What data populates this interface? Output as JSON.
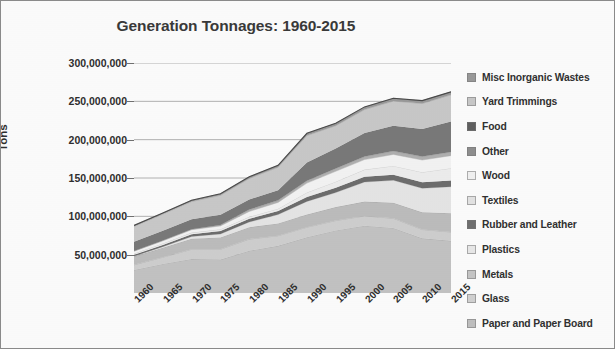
{
  "chart_data": {
    "type": "area",
    "title": "Generation Tonnages: 1960-2015",
    "xlabel": "",
    "ylabel": "Tons",
    "stacked": true,
    "grid": true,
    "legend_position": "right",
    "ylim": [
      0,
      300000000
    ],
    "ytick_labels": [
      "300,000,000",
      "250,000,000",
      "200,000,000",
      "150,000,000",
      "100,000,000",
      "50,000,000"
    ],
    "ytick_values": [
      300000000,
      250000000,
      200000000,
      150000000,
      100000000,
      50000000
    ],
    "categories": [
      "1960",
      "1965",
      "1970",
      "1975",
      "1980",
      "1985",
      "1990",
      "1995",
      "2000",
      "2005",
      "2010",
      "2015"
    ],
    "x": [
      1960,
      1965,
      1970,
      1975,
      1980,
      1985,
      1990,
      1995,
      2000,
      2005,
      2010,
      2015
    ],
    "series": [
      {
        "name": "Paper and Paper Board",
        "color": "#c3c3c3",
        "values": [
          29990000,
          37970000,
          44310000,
          43560000,
          55160000,
          61500000,
          72730000,
          81670000,
          87740000,
          84840000,
          71310000,
          68050000
        ]
      },
      {
        "name": "Glass",
        "color": "#cfcfcf",
        "values": [
          6720000,
          8740000,
          12740000,
          13470000,
          15130000,
          13180000,
          13100000,
          12830000,
          12770000,
          12540000,
          11530000,
          11470000
        ]
      },
      {
        "name": "Metals",
        "color": "#bdbdbd",
        "values": [
          10820000,
          12360000,
          13830000,
          15510000,
          15510000,
          16100000,
          16550000,
          17600000,
          18730000,
          20270000,
          22410000,
          24650000
        ]
      },
      {
        "name": "Plastics",
        "color": "#e6e6e6",
        "values": [
          390000,
          1410000,
          2900000,
          4450000,
          6830000,
          11560000,
          17130000,
          18900000,
          25550000,
          29380000,
          31400000,
          34500000
        ]
      },
      {
        "name": "Rubber and Leather",
        "color": "#6e6e6e",
        "values": [
          1840000,
          2240000,
          2970000,
          4000000,
          4200000,
          4700000,
          5790000,
          6400000,
          6710000,
          7290000,
          7790000,
          8170000
        ]
      },
      {
        "name": "Textiles",
        "color": "#eeeeee",
        "values": [
          1760000,
          1960000,
          2040000,
          2230000,
          2530000,
          2930000,
          5810000,
          7810000,
          9480000,
          11470000,
          13120000,
          16030000
        ]
      },
      {
        "name": "Wood",
        "color": "#f4f4f4",
        "values": [
          3030000,
          3320000,
          3720000,
          4280000,
          7010000,
          8180000,
          12210000,
          13500000,
          13040000,
          14980000,
          15880000,
          16300000
        ]
      },
      {
        "name": "Other",
        "color": "#b0b0b0",
        "values": [
          70000,
          510000,
          770000,
          1280000,
          2520000,
          2710000,
          3190000,
          3780000,
          4000000,
          4290000,
          4580000,
          4810000
        ]
      },
      {
        "name": "Food",
        "color": "#7a7a7a",
        "values": [
          12200000,
          12700000,
          12800000,
          13400000,
          13000000,
          13200000,
          23860000,
          25930000,
          30700000,
          33220000,
          35740000,
          39730000
        ]
      },
      {
        "name": "Yard Trimmings",
        "color": "#c9c9c9",
        "values": [
          20000000,
          21700000,
          23200000,
          25200000,
          27500000,
          30000000,
          35000000,
          29800000,
          30530000,
          32070000,
          33400000,
          34720000
        ]
      },
      {
        "name": "Misc Inorganic Wastes",
        "color": "#9a9a9a",
        "values": [
          1300000,
          1500000,
          1780000,
          2040000,
          2250000,
          2420000,
          2900000,
          3160000,
          3500000,
          3690000,
          3780000,
          3940000
        ]
      }
    ],
    "totals": [
      88120000,
      104410000,
      121060000,
      129420000,
      151640000,
      166480000,
      208270000,
      221380000,
      242750000,
      254040000,
      250940000,
      262370000
    ]
  },
  "legend": {
    "items": [
      {
        "label": "Misc Inorganic Wastes",
        "color": "#9a9a9a"
      },
      {
        "label": "Yard Trimmings",
        "color": "#c9c9c9"
      },
      {
        "label": "Food",
        "color": "#606060"
      },
      {
        "label": "Other",
        "color": "#8f8f8f"
      },
      {
        "label": "Wood",
        "color": "#f2f2f2"
      },
      {
        "label": "Textiles",
        "color": "#e4e4e4"
      },
      {
        "label": "Rubber and Leather",
        "color": "#707070"
      },
      {
        "label": "Plastics",
        "color": "#e9e9e9"
      },
      {
        "label": "Metals",
        "color": "#c6c6c6"
      },
      {
        "label": "Glass",
        "color": "#d2d2d2"
      },
      {
        "label": "Paper and Paper Board",
        "color": "#c0c0c0"
      }
    ]
  }
}
